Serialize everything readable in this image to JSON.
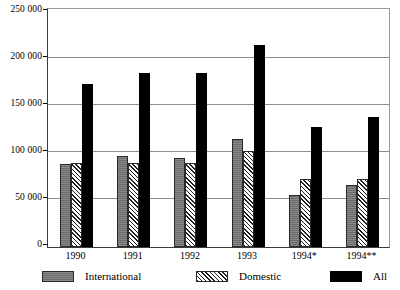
{
  "chart_data": {
    "type": "bar",
    "title": "",
    "subtitle": "",
    "xlabel": "",
    "ylabel": "",
    "categories": [
      "1990",
      "1991",
      "1992",
      "1993",
      "1994*",
      "1994**"
    ],
    "series": [
      {
        "name": "International",
        "values": [
          86000,
          95000,
          93000,
          113000,
          54000,
          65000
        ]
      },
      {
        "name": "Domestic",
        "values": [
          87000,
          87000,
          88000,
          100000,
          71000,
          71000
        ]
      },
      {
        "name": "All",
        "values": [
          170000,
          181000,
          181000,
          210000,
          125000,
          135000
        ]
      }
    ],
    "ylim": [
      0,
      250000
    ],
    "ytick_values": [
      0,
      50000,
      100000,
      150000,
      200000,
      250000
    ],
    "ytick_labels": [
      "0",
      "50 000",
      "100 000",
      "150 000",
      "200 000",
      "250 000"
    ],
    "grid": true,
    "grid_axis": "y",
    "legend_position": "bottom",
    "legend": [
      "International",
      "Domestic",
      "All"
    ],
    "annotations": []
  },
  "colors": {
    "international": "#6a6a6a",
    "domestic": "#ffffff",
    "all": "#000000",
    "gridline": "#8c8c8c",
    "axis": "#3a3a3a",
    "background": "#ffffff"
  }
}
